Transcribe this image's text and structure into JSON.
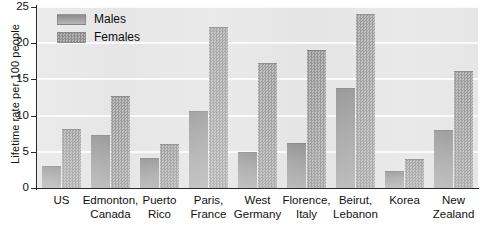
{
  "chart_data": {
    "type": "bar",
    "title": "",
    "xlabel": "",
    "ylabel": "Lifetime rate per 100 people",
    "ylim": [
      0,
      25
    ],
    "yticks": [
      0,
      5,
      10,
      15,
      20,
      25
    ],
    "grid": true,
    "legend_position": "top-left",
    "categories": [
      "US",
      "Edmonton, Canada",
      "Puerto Rico",
      "Paris, France",
      "West Germany",
      "Florence, Italy",
      "Beirut, Lebanon",
      "Korea",
      "New Zealand"
    ],
    "category_lines": [
      [
        "US",
        ""
      ],
      [
        "Edmonton,",
        "Canada"
      ],
      [
        "Puerto",
        "Rico"
      ],
      [
        "Paris,",
        "France"
      ],
      [
        "West",
        "Germany"
      ],
      [
        "Florence,",
        "Italy"
      ],
      [
        "Beirut,",
        "Lebanon"
      ],
      [
        "Korea",
        ""
      ],
      [
        "New",
        "Zealand"
      ]
    ],
    "series": [
      {
        "name": "Males",
        "color": "#a2a2a2",
        "values": [
          3.1,
          7.3,
          4.2,
          10.6,
          5.0,
          6.2,
          13.8,
          2.3,
          8.0
        ]
      },
      {
        "name": "Females",
        "color": "#9a9a9a",
        "values": [
          8.1,
          12.7,
          6.1,
          22.2,
          17.2,
          19.0,
          24.0,
          4.0,
          16.2
        ]
      }
    ]
  },
  "legend": {
    "items": [
      {
        "label": "Males",
        "swatch": "male-swatch"
      },
      {
        "label": "Females",
        "swatch": "female-swatch"
      }
    ]
  },
  "axes": {
    "y_title": "Lifetime rate per 100 people",
    "y_tick_labels": [
      "0",
      "5",
      "10",
      "15",
      "20",
      "25"
    ]
  }
}
